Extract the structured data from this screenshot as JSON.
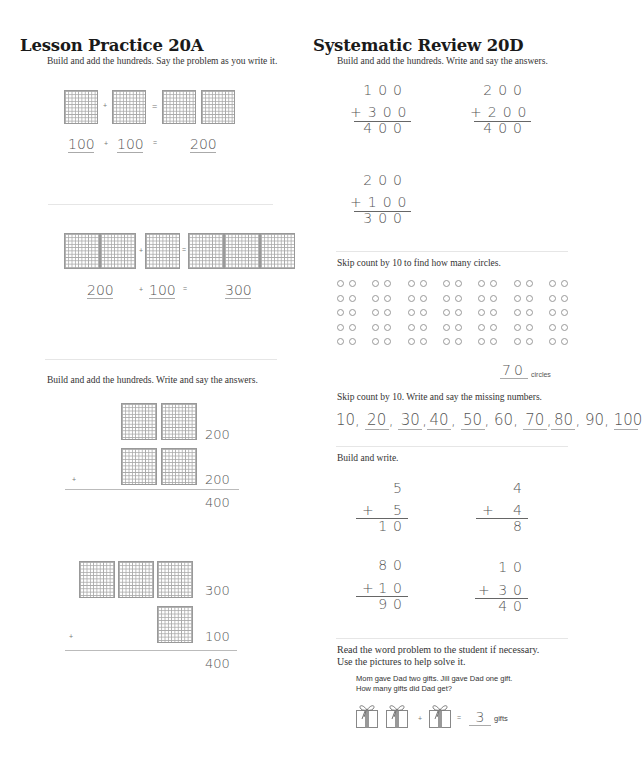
{
  "left": {
    "title": "Lesson Practice 20A",
    "instruction1": "Build and add the hundreds. Say the problem as you write it.",
    "problem1": {
      "a": "100",
      "plus": "+",
      "b": "100",
      "eq": "=",
      "answer": "200"
    },
    "problem2": {
      "a": "200",
      "plus": "+",
      "b": "100",
      "eq": "=",
      "answer": "300"
    },
    "instruction2": "Build and add the hundreds. Write and say the answers.",
    "problem3": {
      "top": "200",
      "bottom": "200",
      "plus": "+",
      "answer": "400"
    },
    "problem4": {
      "top": "300",
      "bottom": "100",
      "plus": "+",
      "answer": "400"
    }
  },
  "right": {
    "title": "Systematic Review 20D",
    "instruction1": "Build and add the hundreds. Write and say the answers.",
    "sums1": [
      {
        "top": "100",
        "bottom": "+300",
        "answer": "400"
      },
      {
        "top": "200",
        "bottom": "+200",
        "answer": "400"
      },
      {
        "top": "200",
        "bottom": "+100",
        "answer": "300"
      }
    ],
    "instruction2": "Skip count by 10 to find how many circles.",
    "circles": {
      "groups": 7,
      "rows": 5,
      "answer": "70",
      "unit": "circles"
    },
    "instruction3": "Skip count by 10. Write and say the missing numbers.",
    "skip_count": [
      "10",
      "20",
      "30",
      "40",
      "50",
      "60",
      "70",
      "80",
      "90",
      "100"
    ],
    "instruction4": "Build and write.",
    "sums2": [
      {
        "top": "5",
        "plus": "+",
        "bottom": "5",
        "answer": "10"
      },
      {
        "top": "4",
        "plus": "+",
        "bottom": "4",
        "answer": "8"
      },
      {
        "top": "80",
        "plus": "+",
        "bottom": "10",
        "answer": "90"
      },
      {
        "top": "10",
        "plus": "+",
        "bottom": "30",
        "answer": "40"
      }
    ],
    "instruction5a": "Read the word problem to the student if necessary.",
    "instruction5b": "Use the pictures to help solve it.",
    "word_problem1": "Mom gave Dad two gifts. Jill gave Dad one gift.",
    "word_problem2": "How many gifts did Dad get?",
    "word_answer": {
      "plus": "+",
      "eq": "=",
      "answer": "3",
      "unit": "gifts"
    }
  }
}
